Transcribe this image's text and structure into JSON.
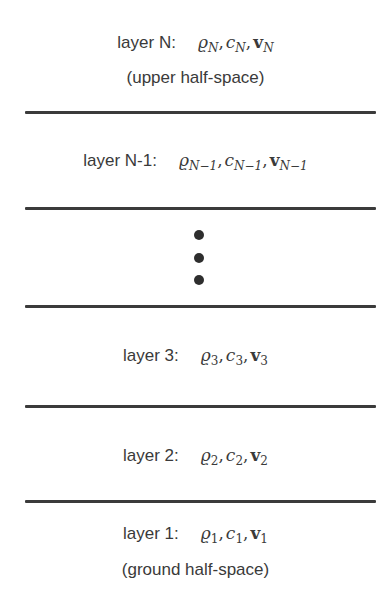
{
  "diagram": {
    "colors": {
      "text": "#3a3a3a",
      "divider": "#3b3b3b",
      "dot": "#2e2e2e",
      "background": "#ffffff"
    },
    "layers": [
      {
        "id": "N",
        "label": "layer N:",
        "params": [
          {
            "symbol": "ϱ",
            "sub": "N",
            "bold": false
          },
          {
            "symbol": "c",
            "sub": "N",
            "bold": false
          },
          {
            "symbol": "v",
            "sub": "N",
            "bold": true
          }
        ],
        "note": "(upper half-space)"
      },
      {
        "id": "N-1",
        "label": "layer N-1:",
        "params": [
          {
            "symbol": "ϱ",
            "sub": "N−1",
            "bold": false
          },
          {
            "symbol": "c",
            "sub": "N−1",
            "bold": false
          },
          {
            "symbol": "v",
            "sub": "N−1",
            "bold": true
          }
        ]
      },
      {
        "id": "ellipsis",
        "label": "⋮"
      },
      {
        "id": "3",
        "label": "layer 3:",
        "params": [
          {
            "symbol": "ϱ",
            "sub": "3",
            "bold": false
          },
          {
            "symbol": "c",
            "sub": "3",
            "bold": false
          },
          {
            "symbol": "v",
            "sub": "3",
            "bold": true
          }
        ]
      },
      {
        "id": "2",
        "label": "layer 2:",
        "params": [
          {
            "symbol": "ϱ",
            "sub": "2",
            "bold": false
          },
          {
            "symbol": "c",
            "sub": "2",
            "bold": false
          },
          {
            "symbol": "v",
            "sub": "2",
            "bold": true
          }
        ]
      },
      {
        "id": "1",
        "label": "layer 1:",
        "params": [
          {
            "symbol": "ϱ",
            "sub": "1",
            "bold": false
          },
          {
            "symbol": "c",
            "sub": "1",
            "bold": false
          },
          {
            "symbol": "v",
            "sub": "1",
            "bold": true
          }
        ],
        "note": "(ground half-space)"
      }
    ],
    "separator": ","
  }
}
